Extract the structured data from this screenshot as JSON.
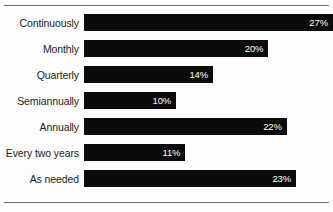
{
  "chart_data": {
    "type": "bar",
    "orientation": "horizontal",
    "title": "",
    "xlabel": "",
    "ylabel": "",
    "grid": false,
    "legend": false,
    "xlim": [
      0,
      27
    ],
    "value_suffix": "%",
    "categories": [
      "Continuously",
      "Monthly",
      "Quarterly",
      "Semiannually",
      "Annually",
      "Every two years",
      "As needed"
    ],
    "values": [
      27,
      20,
      14,
      10,
      22,
      11,
      23
    ],
    "labels": [
      "27%",
      "20%",
      "14%",
      "10%",
      "22%",
      "11%",
      "23%"
    ],
    "colors": {
      "bar": "#0b0b0b",
      "value_text": "#ffffff",
      "category_text": "#1c1c1c",
      "background": "#fdfdfd",
      "rule": "#6e6e6e"
    }
  }
}
